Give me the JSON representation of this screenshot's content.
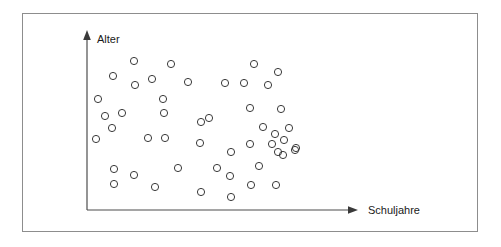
{
  "figure": {
    "type": "scatter",
    "title": "",
    "frame": {
      "stroke_color": "#8d8d8d"
    },
    "axes": {
      "y": {
        "label": "Alter",
        "arrow": "up-arrow-icon",
        "stroke_color": "#4d4d4d",
        "origin": {
          "x": 87,
          "y": 210
        },
        "end": {
          "x": 87,
          "y": 32
        }
      },
      "x": {
        "label": "Schuljahre",
        "arrow": "right-arrow-icon",
        "stroke_color": "#4d4d4d",
        "origin": {
          "x": 87,
          "y": 210
        },
        "end": {
          "x": 357,
          "y": 210
        }
      }
    }
  },
  "chart_data": {
    "type": "scatter",
    "title": "",
    "xlabel": "Schuljahre",
    "ylabel": "Alter",
    "grid": false,
    "legend": null,
    "axis_ticks": {
      "x": [],
      "y": []
    },
    "xlim": [
      87,
      357
    ],
    "ylim": [
      32,
      210
    ],
    "marker": {
      "shape": "circle-open",
      "radius": 3.6,
      "stroke": "#3a3a3a",
      "fill": "none",
      "stroke_width": 1
    },
    "note": "Unlabeled axes; point coordinates are given in pixel space of the original figure (origin at lower-left of the axes).",
    "n_points": 56,
    "points": [
      [
        134,
        61
      ],
      [
        171,
        64
      ],
      [
        254,
        64
      ],
      [
        113,
        76
      ],
      [
        278,
        72
      ],
      [
        152,
        79
      ],
      [
        188,
        82
      ],
      [
        225,
        83
      ],
      [
        244,
        83
      ],
      [
        135,
        85
      ],
      [
        268,
        85
      ],
      [
        98,
        99
      ],
      [
        163,
        99
      ],
      [
        122,
        113
      ],
      [
        164,
        113
      ],
      [
        105,
        116
      ],
      [
        250,
        108
      ],
      [
        281,
        109
      ],
      [
        112,
        128
      ],
      [
        201,
        122
      ],
      [
        209,
        118
      ],
      [
        263,
        127
      ],
      [
        289,
        128
      ],
      [
        96,
        139
      ],
      [
        148,
        138
      ],
      [
        165,
        138
      ],
      [
        275,
        134
      ],
      [
        200,
        143
      ],
      [
        250,
        144
      ],
      [
        272,
        144
      ],
      [
        284,
        140
      ],
      [
        296,
        148
      ],
      [
        231,
        152
      ],
      [
        278,
        152
      ],
      [
        295,
        150
      ],
      [
        283,
        155
      ],
      [
        259,
        166
      ],
      [
        114,
        169
      ],
      [
        178,
        168
      ],
      [
        217,
        168
      ],
      [
        134,
        175
      ],
      [
        230,
        176
      ],
      [
        114,
        184
      ],
      [
        251,
        185
      ],
      [
        276,
        185
      ],
      [
        155,
        187
      ],
      [
        201,
        192
      ],
      [
        231,
        197
      ]
    ]
  }
}
